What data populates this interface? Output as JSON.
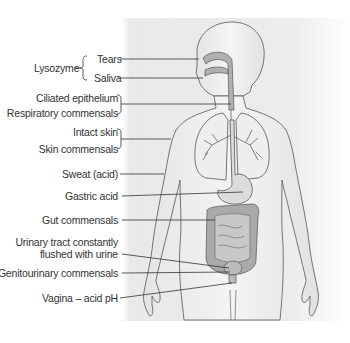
{
  "figure": {
    "colors": {
      "panel_gray": "#e6e6e6",
      "organ_fill": "#b4b4b4",
      "line": "#3a3a3a",
      "text": "#333333"
    }
  },
  "labels": {
    "lysozyme": "Lysozyme",
    "tears": "Tears",
    "saliva": "Saliva",
    "ciliated_epithelium": "Ciliated epithelium",
    "respiratory_commensals": "Respiratory commensals",
    "intact_skin": "Intact skin",
    "skin_commensals": "Skin commensals",
    "sweat": "Sweat (acid)",
    "gastric_acid": "Gastric acid",
    "gut_commensals": "Gut commensals",
    "urinary_line1": "Urinary tract constantly",
    "urinary_line2": "flushed with urine",
    "genitourinary_commensals": "Genitourinary commensals",
    "vagina": "Vagina – acid pH"
  }
}
